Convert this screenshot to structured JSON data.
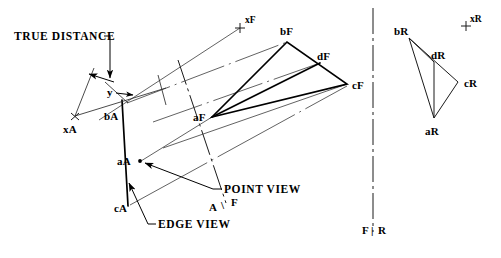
{
  "figure": {
    "background_color": "#ffffff",
    "line_color": "#000000",
    "width": 501,
    "height": 258
  },
  "annotations": {
    "true_distance": "TRUE DISTANCE",
    "point_view": "POINT VIEW",
    "edge_view": "EDGE VIEW",
    "dimension_y": "y"
  },
  "fold_lines": [
    {
      "name": "af-fold",
      "label_left": "A",
      "label_right": "F",
      "separator": "\\"
    },
    {
      "name": "fr-fold",
      "label_left": "F",
      "label_right": "R",
      "separator": "|"
    }
  ],
  "views": {
    "auxiliary": {
      "name": "A",
      "points": [
        {
          "id": "bA",
          "label": "bA",
          "x": 123,
          "y": 102,
          "label_x": 104,
          "label_y": 120
        },
        {
          "id": "aA",
          "label": "aA",
          "x": 140,
          "y": 161,
          "label_x": 117,
          "label_y": 165
        },
        {
          "id": "cA",
          "label": "cA",
          "x": 128,
          "y": 205,
          "label_x": 117,
          "label_y": 212
        },
        {
          "id": "xA",
          "label": "xA",
          "x": 75,
          "y": 116,
          "label_x": 64,
          "label_y": 132
        }
      ]
    },
    "front": {
      "name": "F",
      "points": [
        {
          "id": "aF",
          "label": "aF",
          "x": 212,
          "y": 117,
          "label_x": 194,
          "label_y": 120
        },
        {
          "id": "bF",
          "label": "bF",
          "x": 287,
          "y": 42,
          "label_x": 280,
          "label_y": 34
        },
        {
          "id": "cF",
          "label": "cF",
          "x": 347,
          "y": 84,
          "label_x": 352,
          "label_y": 88
        },
        {
          "id": "dF",
          "label": "dF",
          "x": 320,
          "y": 63,
          "label_x": 318,
          "label_y": 60
        },
        {
          "id": "xF",
          "label": "xF",
          "x": 240,
          "y": 28,
          "label_x": 245,
          "label_y": 22
        }
      ]
    },
    "right": {
      "name": "R",
      "points": [
        {
          "id": "bR",
          "label": "bR",
          "x": 409,
          "y": 38,
          "label_x": 395,
          "label_y": 34
        },
        {
          "id": "cR",
          "label": "cR",
          "x": 458,
          "y": 82,
          "label_x": 464,
          "label_y": 86
        },
        {
          "id": "aR",
          "label": "aR",
          "x": 434,
          "y": 118,
          "label_x": 426,
          "label_y": 134
        },
        {
          "id": "dR",
          "label": "dR",
          "x": 434,
          "y": 62,
          "label_x": 432,
          "label_y": 58
        },
        {
          "id": "xR",
          "label": "xR",
          "x": 466,
          "y": 26,
          "label_x": 470,
          "label_y": 21
        }
      ]
    }
  }
}
